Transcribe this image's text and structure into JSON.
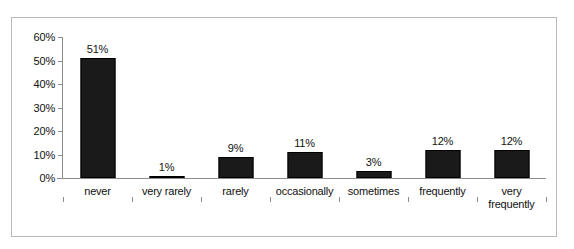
{
  "chart_data": {
    "type": "bar",
    "title": "",
    "subtitle": "",
    "xlabel": "",
    "ylabel": "",
    "categories": [
      "never",
      "very rarely",
      "rarely",
      "occasionally",
      "sometimes",
      "frequently",
      "very frequently"
    ],
    "category_lines": [
      [
        "never"
      ],
      [
        "very rarely"
      ],
      [
        "rarely"
      ],
      [
        "occasionally"
      ],
      [
        "sometimes"
      ],
      [
        "frequently"
      ],
      [
        "very",
        "frequently"
      ]
    ],
    "values": [
      51,
      1,
      9,
      11,
      3,
      12,
      12
    ],
    "data_labels": [
      "51%",
      "1%",
      "9%",
      "11%",
      "3%",
      "12%",
      "12%"
    ],
    "ylim": [
      0,
      60
    ],
    "ytick_values": [
      0,
      10,
      20,
      30,
      40,
      50,
      60
    ],
    "ytick_labels": [
      "0%",
      "10%",
      "20%",
      "30%",
      "40%",
      "50%",
      "60%"
    ],
    "grid": false,
    "legend": null,
    "legend_position": "none",
    "bar_color": "#1a1a1a",
    "axis_color": "#8d8d8d",
    "text_color": "#111111",
    "background_color": "#ffffff",
    "frame_border_color": "#b9b9b9"
  }
}
